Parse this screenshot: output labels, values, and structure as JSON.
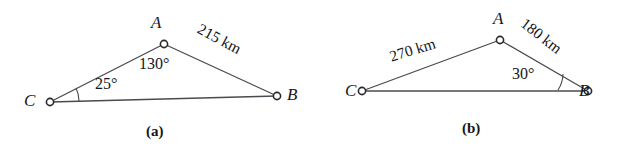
{
  "figure": {
    "background_color": "#ffffff",
    "stroke_color": "#4a4a50",
    "text_color": "#16161a",
    "panels": [
      {
        "caption": "(a)",
        "vertices": [
          {
            "name": "A",
            "label": "A",
            "x": 164,
            "y": 44
          },
          {
            "name": "B",
            "label": "B",
            "x": 277,
            "y": 96
          },
          {
            "name": "C",
            "label": "C",
            "x": 50,
            "y": 102
          }
        ],
        "edges": [
          {
            "from": "C",
            "to": "A"
          },
          {
            "from": "A",
            "to": "B"
          },
          {
            "from": "C",
            "to": "B"
          }
        ],
        "angles": [
          {
            "at": "C",
            "label": "25°"
          },
          {
            "at": "A",
            "label": "130°"
          }
        ],
        "sides": [
          {
            "from": "A",
            "to": "B",
            "label": "215 km",
            "rotation_deg": 28
          }
        ]
      },
      {
        "caption": "(b)",
        "vertices": [
          {
            "name": "A",
            "label": "A",
            "x": 183,
            "y": 40
          },
          {
            "name": "B",
            "label": "B",
            "x": 271,
            "y": 91
          },
          {
            "name": "C",
            "label": "C",
            "x": 45,
            "y": 91
          }
        ],
        "edges": [
          {
            "from": "C",
            "to": "A"
          },
          {
            "from": "A",
            "to": "B"
          },
          {
            "from": "C",
            "to": "B"
          }
        ],
        "angles": [
          {
            "at": "B",
            "label": "30°"
          }
        ],
        "sides": [
          {
            "from": "C",
            "to": "A",
            "label": "270 km",
            "rotation_deg": -17
          },
          {
            "from": "A",
            "to": "B",
            "label": "180 km",
            "rotation_deg": 38
          }
        ]
      }
    ]
  }
}
